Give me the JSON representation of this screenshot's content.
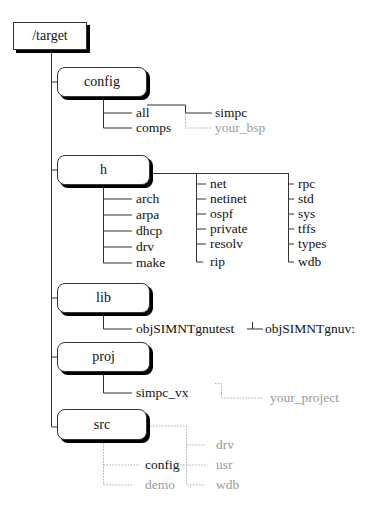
{
  "diagram": {
    "type": "directory-tree",
    "root": {
      "label": "/target"
    },
    "colors": {
      "line": "#333333",
      "optional_line": "#aaaaaa",
      "optional_text": "#9a9a9a"
    },
    "nodes": {
      "config": {
        "label": "config",
        "children": [
          "all",
          "comps"
        ],
        "sub": {
          "simpc": "simpc",
          "your_bsp": "your_bsp"
        }
      },
      "h": {
        "label": "h",
        "col1": [
          "arch",
          "arpa",
          "dhcp",
          "drv",
          "make"
        ],
        "col2": [
          "net",
          "netinet",
          "ospf",
          "private",
          "resolv",
          "rip"
        ],
        "col3": [
          "rpc",
          "std",
          "sys",
          "tffs",
          "types",
          "wdb"
        ]
      },
      "lib": {
        "label": "lib",
        "child": "objSIMNTgnutest",
        "sub": "objSIMNTgnuv:"
      },
      "proj": {
        "label": "proj",
        "child": "simpc_vx",
        "sub": "your_project"
      },
      "src": {
        "label": "src",
        "children": [
          "config",
          "demo"
        ],
        "sub": [
          "drv",
          "usr",
          "wdb"
        ]
      }
    }
  }
}
